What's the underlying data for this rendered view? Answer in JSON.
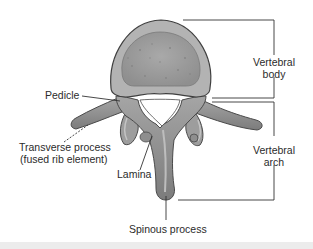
{
  "diagram": {
    "labels": {
      "pedicle": "Pedicle",
      "transverse_process_line1": "Transverse process",
      "transverse_process_line2": "(fused rib element)",
      "lamina": "Lamina",
      "spinous_process": "Spinous process",
      "vertebral_body_line1": "Vertebral",
      "vertebral_body_line2": "body",
      "vertebral_arch_line1": "Vertebral",
      "vertebral_arch_line2": "arch"
    },
    "colors": {
      "bone_fill": "#9a9a9a",
      "bone_dark": "#6b6b6b",
      "body_rim": "#b5b5b5",
      "body_center": "#a3a3a3",
      "outline": "#4a4a4a",
      "leader_line": "#333333"
    }
  }
}
